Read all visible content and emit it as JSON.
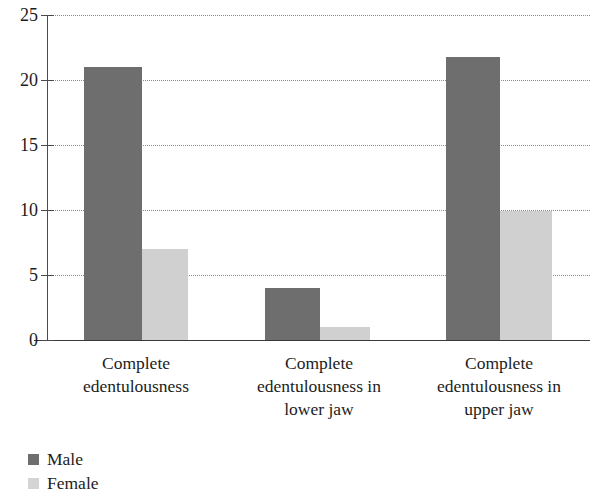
{
  "chart_data": {
    "type": "bar",
    "title": "",
    "subtitle": "",
    "xlabel": "",
    "ylabel": "",
    "ylim": [
      0,
      25
    ],
    "yticks": [
      0,
      5,
      10,
      15,
      20,
      25
    ],
    "ytick_labels": [
      "0",
      "5",
      "10",
      "15",
      "20",
      "25"
    ],
    "grid": true,
    "grid_style": "dotted-horizontal",
    "legend_position": "bottom-left",
    "categories": [
      "Complete edentulousness",
      "Complete edentulousness in lower jaw",
      "Complete edentulousness in upper jaw"
    ],
    "category_lines": [
      [
        "Complete",
        "edentulousness"
      ],
      [
        "Complete",
        "edentulousness in",
        "lower jaw"
      ],
      [
        "Complete",
        "edentulousness in",
        "upper jaw"
      ]
    ],
    "series": [
      {
        "name": "Male",
        "color": "#6e6e6e",
        "values": [
          21,
          4,
          21.8
        ]
      },
      {
        "name": "Female",
        "color": "#d0d0d0",
        "values": [
          7,
          1,
          9.9
        ]
      }
    ]
  },
  "legend": {
    "items": [
      {
        "label": "Male",
        "color": "#6e6e6e"
      },
      {
        "label": "Female",
        "color": "#d4d4d4"
      }
    ]
  },
  "axis": {
    "y_labels": [
      "25",
      "20",
      "15",
      "10",
      "5",
      "0"
    ]
  }
}
